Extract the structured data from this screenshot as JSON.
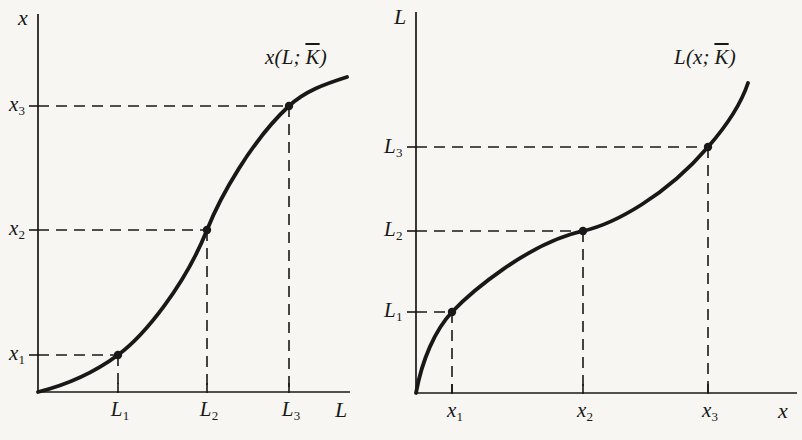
{
  "figure": {
    "background": "#f7f6f2",
    "ink": "#181818"
  },
  "charts": [
    {
      "id": "output-vs-labor",
      "y_axis_label": "x",
      "x_axis_label": "L",
      "curve_label": {
        "prefix": "x(L;",
        "kbar": "K",
        "suffix": ")"
      },
      "y_ticks": [
        {
          "base": "x",
          "sub": "1"
        },
        {
          "base": "x",
          "sub": "2"
        },
        {
          "base": "x",
          "sub": "3"
        }
      ],
      "x_ticks": [
        {
          "base": "L",
          "sub": "1"
        },
        {
          "base": "L",
          "sub": "2"
        },
        {
          "base": "L",
          "sub": "3"
        }
      ],
      "geometry": {
        "origin": [
          38,
          392
        ],
        "y_axis_top": 14,
        "x_axis_right": 350,
        "points": [
          [
            118,
            355
          ],
          [
            207,
            230
          ],
          [
            289,
            106
          ]
        ],
        "curve_path": "M 38 392 C 70 384 95 372 118 355 C 145 335 185 285 207 230 C 220 197 252 140 289 106 C 305 91 325 84 347 77"
      }
    },
    {
      "id": "labor-vs-output",
      "y_axis_label": "L",
      "x_axis_label": "x",
      "curve_label": {
        "prefix": "L(x;",
        "kbar": "K",
        "suffix": ")"
      },
      "y_ticks": [
        {
          "base": "L",
          "sub": "1"
        },
        {
          "base": "L",
          "sub": "2"
        },
        {
          "base": "L",
          "sub": "3"
        }
      ],
      "x_ticks": [
        {
          "base": "x",
          "sub": "1"
        },
        {
          "base": "x",
          "sub": "2"
        },
        {
          "base": "x",
          "sub": "3"
        }
      ],
      "geometry": {
        "origin": [
          416,
          393
        ],
        "y_axis_top": 12,
        "x_axis_right": 797,
        "points": [
          [
            452,
            312
          ],
          [
            583,
            231
          ],
          [
            708,
            147
          ]
        ],
        "curve_path": "M 416 393 C 422 360 435 330 452 312 C 470 293 528 243 583 231 C 614 224 666 196 708 147 C 722 131 740 107 748 83"
      }
    }
  ],
  "chart_data": [
    {
      "type": "line",
      "title": "x(L; K̄) — output as a function of labor with capital fixed",
      "xlabel": "L",
      "ylabel": "x",
      "x_tick_labels": [
        "L1",
        "L2",
        "L3"
      ],
      "y_tick_labels": [
        "x1",
        "x2",
        "x3"
      ],
      "x_ticks_norm": [
        0.26,
        0.54,
        0.8
      ],
      "y_ticks_norm": [
        0.1,
        0.43,
        0.76
      ],
      "marked_points_norm": [
        [
          0.26,
          0.1
        ],
        [
          0.54,
          0.43
        ],
        [
          0.8,
          0.76
        ]
      ],
      "curve_endpoints_norm": [
        [
          0.0,
          0.0
        ],
        [
          0.99,
          0.835
        ]
      ],
      "curve_shape": "S-shaped: convex (increasing marginal product) up to inflection at (L2, x2), then concave (diminishing marginal product)",
      "guides": "dashed projection lines from each marked point to both axes",
      "grid": false,
      "legend": false
    },
    {
      "type": "line",
      "title": "L(x; K̄) — labor requirement as a function of output (inverse of left panel)",
      "xlabel": "x",
      "ylabel": "L",
      "x_tick_labels": [
        "x1",
        "x2",
        "x3"
      ],
      "y_tick_labels": [
        "L1",
        "L2",
        "L3"
      ],
      "x_ticks_norm": [
        0.1,
        0.44,
        0.77
      ],
      "y_ticks_norm": [
        0.21,
        0.43,
        0.65
      ],
      "marked_points_norm": [
        [
          0.1,
          0.21
        ],
        [
          0.44,
          0.43
        ],
        [
          0.77,
          0.65
        ]
      ],
      "curve_endpoints_norm": [
        [
          0.0,
          0.0
        ],
        [
          0.87,
          0.81
        ]
      ],
      "curve_shape": "inverse S: steep and concave near origin, flattens through inflection at (x2, L2), then convex and steep again",
      "guides": "dashed projection lines from each marked point to both axes",
      "grid": false,
      "legend": false
    }
  ]
}
